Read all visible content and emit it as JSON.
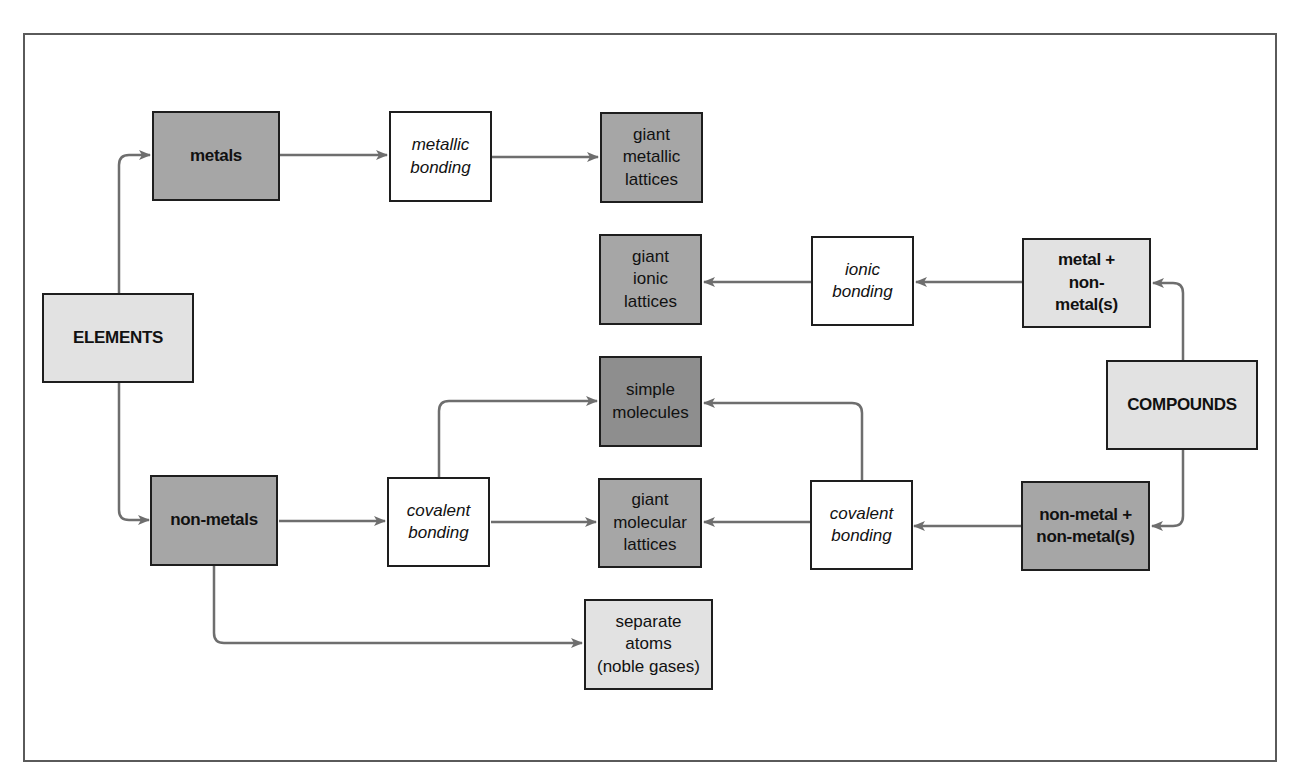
{
  "diagram": {
    "type": "flowchart",
    "colors": {
      "frame": "#5a5a5a",
      "border": "#1e1e1e",
      "arrow": "#6e6e6e",
      "light_fill": "#e2e2e2",
      "mid_fill": "#a6a6a6",
      "dark_fill": "#8e8e8e",
      "white_fill": "#ffffff"
    },
    "nodes": {
      "elements": "ELEMENTS",
      "metals": "metals",
      "non_metals": "non-metals",
      "metallic_bonding": "metallic\nbonding",
      "giant_metallic_lattices": "giant\nmetallic\nlattices",
      "giant_ionic_lattices": "giant\nionic\nlattices",
      "ionic_bonding": "ionic\nbonding",
      "metal_non_metal": "metal +\nnon-\nmetal(s)",
      "compounds": "COMPOUNDS",
      "simple_molecules": "simple\nmolecules",
      "giant_molecular_lattices": "giant\nmolecular\nlattices",
      "covalent_bonding_left": "covalent\nbonding",
      "covalent_bonding_right": "covalent\nbonding",
      "non_metal_non_metal": "non-metal +\nnon-metal(s)",
      "separate_atoms": "separate\natoms\n(noble gases)"
    },
    "edges": [
      {
        "from": "ELEMENTS",
        "to": "metals"
      },
      {
        "from": "ELEMENTS",
        "to": "non-metals"
      },
      {
        "from": "metals",
        "to": "metallic bonding"
      },
      {
        "from": "metallic bonding",
        "to": "giant metallic lattices"
      },
      {
        "from": "non-metals",
        "to": "covalent bonding"
      },
      {
        "from": "non-metals",
        "to": "separate atoms (noble gases)"
      },
      {
        "from": "covalent bonding",
        "to": "simple molecules"
      },
      {
        "from": "covalent bonding",
        "to": "giant molecular lattices"
      },
      {
        "from": "COMPOUNDS",
        "to": "metal + non-metal(s)"
      },
      {
        "from": "COMPOUNDS",
        "to": "non-metal + non-metal(s)"
      },
      {
        "from": "metal + non-metal(s)",
        "to": "ionic bonding"
      },
      {
        "from": "ionic bonding",
        "to": "giant ionic lattices"
      },
      {
        "from": "non-metal + non-metal(s)",
        "to": "covalent bonding"
      },
      {
        "from": "covalent bonding (right)",
        "to": "simple molecules"
      },
      {
        "from": "covalent bonding (right)",
        "to": "giant molecular lattices"
      }
    ]
  }
}
